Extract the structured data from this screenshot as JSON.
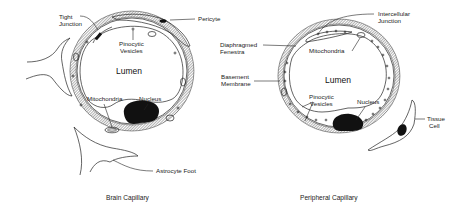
{
  "figure": {
    "panels": [
      {
        "caption": "Brain Capillary",
        "lumen": "Lumen",
        "labels": {
          "tight_junction": [
            "Tight",
            "Junction"
          ],
          "pericyte": "Pericyte",
          "pinocytic_vesicles": [
            "Pinocytic",
            "Vesicles"
          ],
          "mitochondria": "Mitochondria",
          "nucleus": "Nucleus",
          "astrocyte_foot": "Astrocyte Foot"
        }
      },
      {
        "caption": "Peripheral Capillary",
        "lumen": "Lumen",
        "labels": {
          "intercellular_junction": [
            "Intercellular",
            "Junction"
          ],
          "diaphragmed_fenestra": [
            "Diaphragmed",
            "Fenestra"
          ],
          "mitochondria": "Mitochondria",
          "basement_membrane": [
            "Basement",
            "Membrane"
          ],
          "pinocytic_vesicles": [
            "Pinocytic",
            "Vesicles"
          ],
          "nucleus": "Nucleus",
          "tissue_cell": [
            "Tissue",
            "Cell"
          ]
        }
      }
    ]
  }
}
